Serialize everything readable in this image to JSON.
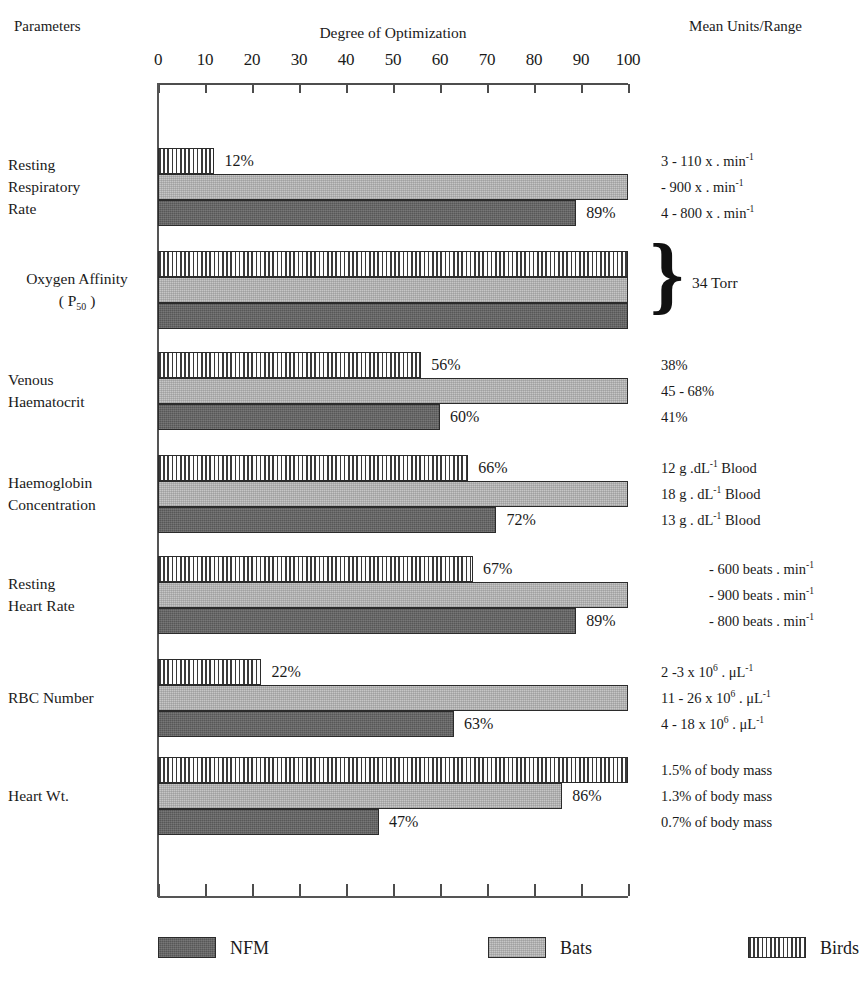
{
  "header": {
    "parameters_label": "Parameters",
    "degree_label": "Degree of Optimization",
    "units_label": "Mean Units/Range"
  },
  "axis": {
    "ticks": [
      0,
      10,
      20,
      30,
      40,
      50,
      60,
      70,
      80,
      90,
      100
    ],
    "min": 0,
    "max": 100
  },
  "legend": [
    {
      "name": "NFM",
      "pattern": "solid-dark"
    },
    {
      "name": "Bats",
      "pattern": "light-stipple"
    },
    {
      "name": "Birds",
      "pattern": "vertical-stripes"
    }
  ],
  "brace": {
    "glyph": "}",
    "text": "34 Torr"
  },
  "chart_data": {
    "type": "bar",
    "orientation": "horizontal",
    "title": "Degree of Optimization",
    "xlabel": "Degree of Optimization",
    "ylabel": "Parameters",
    "xlim": [
      0,
      100
    ],
    "grid": false,
    "legend_position": "bottom",
    "series": [
      {
        "name": "Birds",
        "values": [
          12,
          100,
          56,
          66,
          67,
          22,
          100
        ]
      },
      {
        "name": "Bats",
        "values": [
          100,
          100,
          100,
          100,
          100,
          100,
          86
        ]
      },
      {
        "name": "NFM",
        "values": [
          89,
          100,
          60,
          72,
          89,
          63,
          47
        ]
      }
    ],
    "categories": [
      "Resting Respiratory Rate",
      "Oxygen Affinity ( P50 )",
      "Venous Haematocrit",
      "Haemoglobin Concentration",
      "Resting Heart Rate",
      "RBC Number",
      "Heart Wt."
    ],
    "groups": [
      {
        "id": "resting-respiratory-rate",
        "label_lines": [
          "Resting",
          "Respiratory",
          "Rate"
        ],
        "label_align": "left",
        "units_align": "left",
        "bars": [
          {
            "series": "Birds",
            "value": 12,
            "value_label": "12%"
          },
          {
            "series": "Bats",
            "value": 100,
            "value_label": ""
          },
          {
            "series": "NFM",
            "value": 89,
            "value_label": "89%"
          }
        ],
        "units": [
          "3 - 110 x . min-1",
          "- 900 x . min-1",
          "4 - 800 x . min-1"
        ]
      },
      {
        "id": "oxygen-affinity",
        "label_lines": [
          "Oxygen Affinity",
          "( P50 )"
        ],
        "label_align": "center",
        "units_align": "brace",
        "bars": [
          {
            "series": "Birds",
            "value": 100,
            "value_label": ""
          },
          {
            "series": "Bats",
            "value": 100,
            "value_label": ""
          },
          {
            "series": "NFM",
            "value": 100,
            "value_label": ""
          }
        ],
        "units": [
          "34 Torr"
        ]
      },
      {
        "id": "venous-haematocrit",
        "label_lines": [
          "Venous",
          "Haematocrit"
        ],
        "label_align": "left",
        "units_align": "left",
        "bars": [
          {
            "series": "Birds",
            "value": 56,
            "value_label": "56%"
          },
          {
            "series": "Bats",
            "value": 100,
            "value_label": ""
          },
          {
            "series": "NFM",
            "value": 60,
            "value_label": "60%"
          }
        ],
        "units": [
          "38%",
          "45 - 68%",
          "41%"
        ]
      },
      {
        "id": "haemoglobin-concentration",
        "label_lines": [
          "Haemoglobin",
          "Concentration"
        ],
        "label_align": "left",
        "units_align": "left",
        "bars": [
          {
            "series": "Birds",
            "value": 66,
            "value_label": "66%"
          },
          {
            "series": "Bats",
            "value": 100,
            "value_label": ""
          },
          {
            "series": "NFM",
            "value": 72,
            "value_label": "72%"
          }
        ],
        "units": [
          "12 g .dL-1 Blood",
          "18 g . dL-1 Blood",
          "13 g . dL-1 Blood"
        ]
      },
      {
        "id": "resting-heart-rate",
        "label_lines": [
          "Resting",
          "Heart Rate"
        ],
        "label_align": "left",
        "units_align": "right",
        "bars": [
          {
            "series": "Birds",
            "value": 67,
            "value_label": "67%"
          },
          {
            "series": "Bats",
            "value": 100,
            "value_label": ""
          },
          {
            "series": "NFM",
            "value": 89,
            "value_label": "89%"
          }
        ],
        "units": [
          "- 600 beats . min-1",
          "- 900 beats . min-1",
          "- 800 beats . min-1"
        ]
      },
      {
        "id": "rbc-number",
        "label_lines": [
          "RBC Number"
        ],
        "label_align": "left",
        "units_align": "left",
        "bars": [
          {
            "series": "Birds",
            "value": 22,
            "value_label": "22%"
          },
          {
            "series": "Bats",
            "value": 100,
            "value_label": ""
          },
          {
            "series": "NFM",
            "value": 63,
            "value_label": "63%"
          }
        ],
        "units": [
          "2 -3 x 10^6 . uL-1",
          "11 -  26 x 10^6 . uL-1",
          "4 - 18 x 10^6 . uL-1"
        ]
      },
      {
        "id": "heart-wt",
        "label_lines": [
          "Heart Wt."
        ],
        "label_align": "left",
        "units_align": "left",
        "bars": [
          {
            "series": "Birds",
            "value": 100,
            "value_label": ""
          },
          {
            "series": "Bats",
            "value": 86,
            "value_label": "86%"
          },
          {
            "series": "NFM",
            "value": 47,
            "value_label": "47%"
          }
        ],
        "units": [
          "1.5% of body mass",
          "1.3%  of body mass",
          "0.7% of body mass"
        ]
      }
    ]
  }
}
